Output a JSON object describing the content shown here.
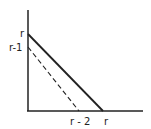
{
  "diagram": {
    "y_axis_labels": {
      "top": "r",
      "lower": "r-1"
    },
    "x_axis_labels": {
      "left": "r - 2",
      "right": "r"
    },
    "lines": [
      {
        "name": "solid",
        "style": "solid",
        "from": "(0, r)",
        "to": "(r, 0)"
      },
      {
        "name": "dashed",
        "style": "dashed",
        "from": "(0, r-1)",
        "to": "(r-2, 0)"
      }
    ],
    "colors": {
      "stroke": "#222222",
      "background": "#ffffff"
    }
  }
}
